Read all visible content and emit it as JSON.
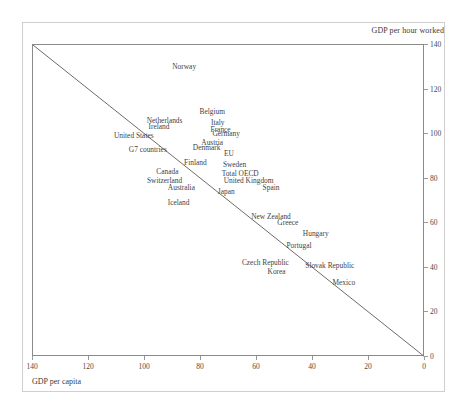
{
  "chart_data": {
    "type": "scatter",
    "title": "",
    "subtitle": "",
    "xlabel": "GDP per capita",
    "ylabel": "GDP per hour worked",
    "xlim": [
      140,
      0
    ],
    "ylim": [
      0,
      140
    ],
    "x_axis_reversed": true,
    "y_axis_side": "right",
    "grid": false,
    "legend": "none",
    "xticks": [
      140,
      120,
      100,
      80,
      60,
      40,
      20,
      0
    ],
    "yticks": [
      0,
      20,
      40,
      60,
      80,
      100,
      120,
      140
    ],
    "reference_line": {
      "label": "45-degree line",
      "from": [
        140,
        140
      ],
      "to": [
        0,
        0
      ]
    },
    "marker_style": "text-only",
    "points": [
      {
        "label": "Norway",
        "x": 86,
        "y": 130
      },
      {
        "label": "Belgium",
        "x": 76,
        "y": 110
      },
      {
        "label": "Netherlands",
        "x": 93,
        "y": 106
      },
      {
        "label": "Italy",
        "x": 74,
        "y": 105
      },
      {
        "label": "Ireland",
        "x": 95,
        "y": 103
      },
      {
        "label": "France",
        "x": 73,
        "y": 102
      },
      {
        "label": "Germany",
        "x": 71,
        "y": 100
      },
      {
        "label": "United States",
        "x": 104,
        "y": 99
      },
      {
        "label": "Austria",
        "x": 76,
        "y": 96
      },
      {
        "label": "Denmark",
        "x": 78,
        "y": 94
      },
      {
        "label": "G7 countries",
        "x": 99,
        "y": 93
      },
      {
        "label": "EU",
        "x": 70,
        "y": 91
      },
      {
        "label": "Finland",
        "x": 82,
        "y": 87
      },
      {
        "label": "Sweden",
        "x": 68,
        "y": 86
      },
      {
        "label": "Canada",
        "x": 92,
        "y": 83
      },
      {
        "label": "Total OECD",
        "x": 66,
        "y": 82
      },
      {
        "label": "Switzerland",
        "x": 93,
        "y": 79
      },
      {
        "label": "United Kingdom",
        "x": 63,
        "y": 79
      },
      {
        "label": "Australia",
        "x": 87,
        "y": 76
      },
      {
        "label": "Spain",
        "x": 55,
        "y": 76
      },
      {
        "label": "Japan",
        "x": 71,
        "y": 74
      },
      {
        "label": "Iceland",
        "x": 88,
        "y": 69
      },
      {
        "label": "New Zealand",
        "x": 55,
        "y": 63
      },
      {
        "label": "Greece",
        "x": 49,
        "y": 60
      },
      {
        "label": "Hungary",
        "x": 39,
        "y": 55
      },
      {
        "label": "Portugal",
        "x": 45,
        "y": 50
      },
      {
        "label": "Czech Republic",
        "x": 57,
        "y": 42
      },
      {
        "label": "Slovak Republic",
        "x": 34,
        "y": 41
      },
      {
        "label": "Korea",
        "x": 53,
        "y": 38
      },
      {
        "label": "Mexico",
        "x": 29,
        "y": 33
      }
    ]
  }
}
